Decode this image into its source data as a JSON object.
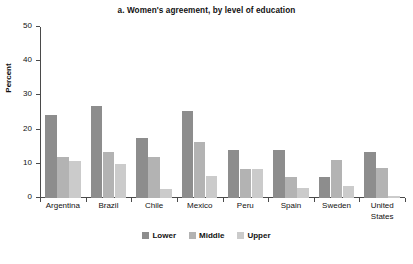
{
  "chart_data": {
    "type": "bar",
    "title": "a. Women's agreement, by level of education",
    "xlabel": "",
    "ylabel": "Percent",
    "ylim": [
      0,
      50
    ],
    "yticks": [
      0,
      10,
      20,
      30,
      40,
      50
    ],
    "ytick_labels": [
      "0",
      "10",
      "20",
      "30",
      "40",
      "50"
    ],
    "grid": false,
    "legend_position": "bottom-center",
    "categories": [
      "Argentina",
      "Brazil",
      "Chile",
      "Mexico",
      "Peru",
      "Spain",
      "Sweden",
      "United\nStates"
    ],
    "series": [
      {
        "name": "Lower",
        "color": "#8d8d8d",
        "values": [
          24.3,
          26.9,
          17.5,
          25.3,
          14.1,
          14.1,
          6.0,
          13.5
        ]
      },
      {
        "name": "Middle",
        "color": "#b3b3b3",
        "values": [
          12.1,
          13.4,
          11.9,
          16.3,
          8.6,
          6.1,
          11.0,
          8.9
        ]
      },
      {
        "name": "Upper",
        "color": "#cbcbcb",
        "values": [
          10.9,
          9.8,
          2.5,
          6.5,
          8.4,
          3.0,
          3.5,
          0.7
        ]
      }
    ]
  },
  "legend": {
    "items": [
      {
        "label": "Lower"
      },
      {
        "label": "Middle"
      },
      {
        "label": "Upper"
      }
    ]
  }
}
